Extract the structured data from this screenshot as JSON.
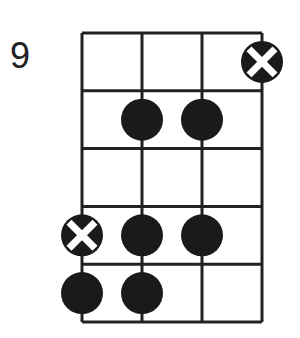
{
  "diagram": {
    "type": "fretboard-chord-diagram",
    "start_fret_label": "9",
    "strings": 4,
    "frets": 5,
    "colors": {
      "line": "#222222",
      "dot": "#1a1a1a",
      "x_mark": "#ffffff",
      "background": "#ffffff"
    },
    "notes": [
      {
        "string": 4,
        "fret": 1,
        "kind": "x-mark"
      },
      {
        "string": 2,
        "fret": 2,
        "kind": "dot"
      },
      {
        "string": 3,
        "fret": 2,
        "kind": "dot"
      },
      {
        "string": 1,
        "fret": 4,
        "kind": "x-mark"
      },
      {
        "string": 2,
        "fret": 4,
        "kind": "dot"
      },
      {
        "string": 3,
        "fret": 4,
        "kind": "dot"
      },
      {
        "string": 1,
        "fret": 5,
        "kind": "dot"
      },
      {
        "string": 2,
        "fret": 5,
        "kind": "dot"
      }
    ]
  }
}
